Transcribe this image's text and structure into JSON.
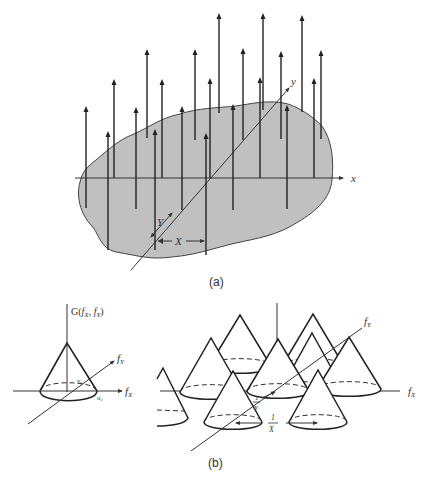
{
  "panel_a": {
    "caption": "(a)",
    "x_axis_label": "x",
    "y_axis_label": "y",
    "spacing_x_label": "X",
    "spacing_y_label": "Y",
    "region_fill": "#c0c0c0",
    "arrows": [
      {
        "x": 86,
        "y_base": 208,
        "y_tip": 106
      },
      {
        "x": 108,
        "y_base": 250,
        "y_tip": 131
      },
      {
        "x": 114,
        "y_base": 178,
        "y_tip": 79
      },
      {
        "x": 136,
        "y_base": 209,
        "y_tip": 107
      },
      {
        "x": 147,
        "y_base": 138,
        "y_tip": 49
      },
      {
        "x": 155,
        "y_base": 250,
        "y_tip": 129
      },
      {
        "x": 162,
        "y_base": 178,
        "y_tip": 79
      },
      {
        "x": 182,
        "y_base": 210,
        "y_tip": 106
      },
      {
        "x": 195,
        "y_base": 140,
        "y_tip": 49
      },
      {
        "x": 206,
        "y_base": 255,
        "y_tip": 133
      },
      {
        "x": 210,
        "y_base": 178,
        "y_tip": 78
      },
      {
        "x": 219,
        "y_base": 113,
        "y_tip": 13
      },
      {
        "x": 233,
        "y_base": 210,
        "y_tip": 104
      },
      {
        "x": 243,
        "y_base": 140,
        "y_tip": 48
      },
      {
        "x": 260,
        "y_base": 178,
        "y_tip": 77
      },
      {
        "x": 263,
        "y_base": 110,
        "y_tip": 13
      },
      {
        "x": 281,
        "y_base": 139,
        "y_tip": 51
      },
      {
        "x": 287,
        "y_base": 209,
        "y_tip": 105
      },
      {
        "x": 302,
        "y_base": 112,
        "y_tip": 15
      },
      {
        "x": 314,
        "y_base": 178,
        "y_tip": 78
      },
      {
        "x": 321,
        "y_base": 139,
        "y_tip": 50
      }
    ]
  },
  "panel_b": {
    "caption": "(b)",
    "left": {
      "function_label": "G(f_X, f_Y)",
      "function_label_parts": {
        "G": "G(",
        "fx": "f",
        "fx_sub": "X",
        "sep": ", ",
        "fy": "f",
        "fy_sub": "Y",
        "close": ")"
      },
      "fx_label": "f",
      "fx_sub": "X",
      "fy_label": "f",
      "fy_sub": "Y",
      "u_label": "u",
      "u_sub": "c",
      "v_label": "v",
      "v_sub": "c"
    },
    "right": {
      "fx_label": "f",
      "fx_sub": "X",
      "fy_label": "f",
      "fy_sub": "Y",
      "inv_x_num": "1",
      "inv_x_den": "X",
      "inv_y_num": "1",
      "inv_y_den": "Y"
    }
  }
}
